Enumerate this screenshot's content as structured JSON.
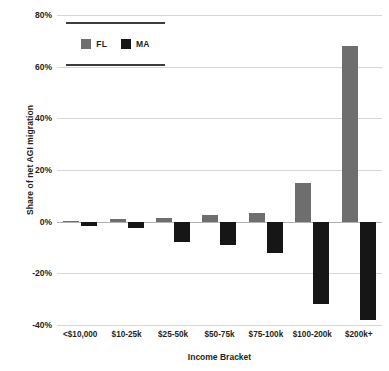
{
  "chart_data": {
    "type": "bar",
    "title": "",
    "subtitle": "",
    "xlabel": "Income Bracket",
    "ylabel": "Share of net AGI migration",
    "categories": [
      "<$10,000",
      "$10-25k",
      "$25-50k",
      "$50-75k",
      "$75-100k",
      "$100-200k",
      "$200k+"
    ],
    "series": [
      {
        "name": "FL",
        "color": "#6e6e6e",
        "values": [
          0.2,
          1,
          1.5,
          2.5,
          3.5,
          15,
          68
        ]
      },
      {
        "name": "MA",
        "color": "#161616",
        "values": [
          -1.5,
          -2.5,
          -8,
          -9,
          -12,
          -32,
          -38
        ]
      }
    ],
    "ylim": [
      -40,
      80
    ],
    "yticks": [
      80,
      60,
      40,
      20,
      0,
      -20,
      -40
    ],
    "ytick_labels": [
      "80%",
      "60%",
      "40%",
      "20%",
      "0%",
      "-20%",
      "-40%"
    ],
    "grid": true,
    "legend_position": "top-left",
    "value_format": "percent"
  },
  "legend": {
    "items": [
      {
        "label": "FL",
        "color": "#6e6e6e"
      },
      {
        "label": "MA",
        "color": "#161616"
      }
    ]
  }
}
